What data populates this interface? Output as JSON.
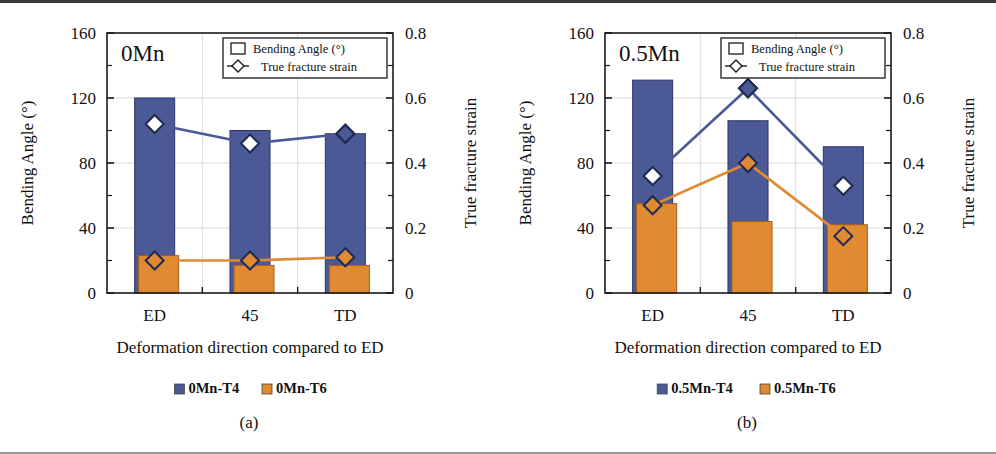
{
  "figure": {
    "panel_count": 2,
    "background_color": "#ffffff"
  },
  "colors": {
    "series_t4": "#4b5a96",
    "series_t6": "#e08a33",
    "axis": "#1a1a1a",
    "gridline": "#d9d9d9",
    "marker_edge": "#1f2a52",
    "marker_face_open": "#ffffff"
  },
  "panels": [
    {
      "id": "panel-a",
      "title": "0Mn",
      "subcaption": "(a)",
      "axes": {
        "y_left_label": "Bending Angle (°)",
        "y_right_label": "True fracture strain",
        "x_label": "Deformation direction compared to ED",
        "y_left_ticks": [
          "0",
          "40",
          "80",
          "120",
          "160"
        ],
        "y_right_ticks": [
          "0",
          "0.2",
          "0.4",
          "0.6",
          "0.8"
        ],
        "x_ticks": [
          "ED",
          "45",
          "TD"
        ]
      },
      "legend_inset": {
        "bar_entry": "Bending Angle (°)",
        "line_entry": "True fracture  strain"
      },
      "series_legend": [
        {
          "label": "0Mn-T4",
          "color": "#4b5a96"
        },
        {
          "label": "0Mn-T6",
          "color": "#e08a33"
        }
      ],
      "chart_data": {
        "type": "bar",
        "title": "0Mn",
        "xlabel": "Deformation direction compared to ED",
        "ylabel": "Bending Angle (°)",
        "y2label": "True fracture strain",
        "categories": [
          "ED",
          "45",
          "TD"
        ],
        "ylim": [
          0,
          160
        ],
        "y2lim": [
          0,
          0.8
        ],
        "grid": true,
        "legend_position": "top-right-inset",
        "bar_series": [
          {
            "name": "0Mn-T4",
            "axis": "left",
            "color": "#4b5a96",
            "values": [
              120,
              100,
              98
            ]
          },
          {
            "name": "0Mn-T6",
            "axis": "left",
            "color": "#e08a33",
            "values": [
              23,
              17,
              17
            ]
          }
        ],
        "line_series": [
          {
            "name": "True fracture strain (0Mn-T4)",
            "axis": "right",
            "color": "#4b5a96",
            "marker": "diamond-open",
            "values": [
              0.52,
              0.46,
              0.49
            ]
          },
          {
            "name": "True fracture strain (0Mn-T6)",
            "axis": "right",
            "color": "#e08a33",
            "marker": "diamond-filled",
            "values": [
              0.1,
              0.1,
              0.11
            ]
          }
        ]
      }
    },
    {
      "id": "panel-b",
      "title": "0.5Mn",
      "subcaption": "(b)",
      "axes": {
        "y_left_label": "Bending Angle (°)",
        "y_right_label": "True fracture strain",
        "x_label": "Deformation direction compared to ED",
        "y_left_ticks": [
          "0",
          "40",
          "80",
          "120",
          "160"
        ],
        "y_right_ticks": [
          "0",
          "0.2",
          "0.4",
          "0.6",
          "0.8"
        ],
        "x_ticks": [
          "ED",
          "45",
          "TD"
        ]
      },
      "legend_inset": {
        "bar_entry": "Bending Angle (°)",
        "line_entry": "True fracture  strain"
      },
      "series_legend": [
        {
          "label": "0.5Mn-T4",
          "color": "#4b5a96"
        },
        {
          "label": "0.5Mn-T6",
          "color": "#e08a33"
        }
      ],
      "chart_data": {
        "type": "bar",
        "title": "0.5Mn",
        "xlabel": "Deformation direction compared to ED",
        "ylabel": "Bending Angle (°)",
        "y2label": "True fracture strain",
        "categories": [
          "ED",
          "45",
          "TD"
        ],
        "ylim": [
          0,
          160
        ],
        "y2lim": [
          0,
          0.8
        ],
        "grid": true,
        "legend_position": "top-right-inset",
        "bar_series": [
          {
            "name": "0.5Mn-T4",
            "axis": "left",
            "color": "#4b5a96",
            "values": [
              131,
              106,
              90
            ]
          },
          {
            "name": "0.5Mn-T6",
            "axis": "left",
            "color": "#e08a33",
            "values": [
              55,
              44,
              42
            ]
          }
        ],
        "line_series": [
          {
            "name": "True fracture strain (0.5Mn-T4)",
            "axis": "right",
            "color": "#4b5a96",
            "marker": "diamond-open",
            "values": [
              0.36,
              0.63,
              0.33
            ]
          },
          {
            "name": "True fracture strain (0.5Mn-T6)",
            "axis": "right",
            "color": "#e08a33",
            "marker": "diamond-filled",
            "values": [
              0.27,
              0.4,
              0.175
            ]
          }
        ]
      }
    }
  ]
}
